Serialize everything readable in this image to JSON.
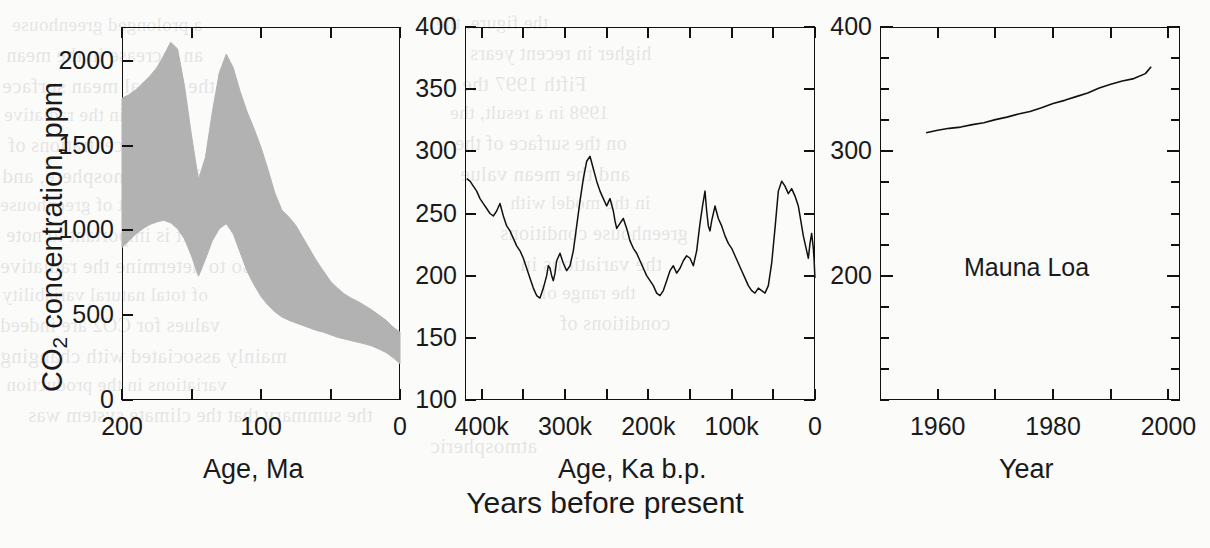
{
  "figure": {
    "caption": "Years before present",
    "background_color": "#fbfbfa",
    "ink_color": "#111111",
    "band_fill_color": "#b2b2b2"
  },
  "y_axis_title": {
    "prefix": "CO",
    "subscript": "2",
    "suffix": " concentration, ppm"
  },
  "ghost_text": [
    {
      "text": "a prolonged greenhouse",
      "x": 12,
      "y": 14
    },
    {
      "text": "an increase in the mean",
      "x": 6,
      "y": 44
    },
    {
      "text": "the annual mean surface",
      "x": 2,
      "y": 74
    },
    {
      "text": "change in the radiative",
      "x": 4,
      "y": 104
    },
    {
      "text": "the concentrations of",
      "x": 8,
      "y": 134
    },
    {
      "text": "in the atmosphere, and",
      "x": 2,
      "y": 164
    },
    {
      "text": "the amount of greenhouse",
      "x": 0,
      "y": 194
    },
    {
      "text": "It is important to note",
      "x": 6,
      "y": 224
    },
    {
      "text": "also to determine the radiative",
      "x": 0,
      "y": 254
    },
    {
      "text": "of total natural variability",
      "x": 2,
      "y": 284
    },
    {
      "text": "values for CO2 are indeed",
      "x": 0,
      "y": 314
    },
    {
      "text": "mainly associated with changing",
      "x": 0,
      "y": 344
    },
    {
      "text": "variations in the production",
      "x": 6,
      "y": 374
    },
    {
      "text": "the summary that the climate system was",
      "x": 28,
      "y": 404
    },
    {
      "text": "atmospheric",
      "x": 430,
      "y": 434
    },
    {
      "text": "the figure, the",
      "x": 436,
      "y": 12
    },
    {
      "text": "higher in recent years",
      "x": 470,
      "y": 42
    },
    {
      "text": "Fifth 1997 the",
      "x": 462,
      "y": 72
    },
    {
      "text": "1998 in a result, the",
      "x": 450,
      "y": 102
    },
    {
      "text": "on the surface of the",
      "x": 455,
      "y": 132
    },
    {
      "text": "and the mean value",
      "x": 460,
      "y": 162
    },
    {
      "text": "in the model with",
      "x": 510,
      "y": 192
    },
    {
      "text": "greenhouse conditions",
      "x": 500,
      "y": 222
    },
    {
      "text": "the variations in",
      "x": 520,
      "y": 252
    },
    {
      "text": "the range of",
      "x": 540,
      "y": 282
    },
    {
      "text": "conditions of",
      "x": 560,
      "y": 312
    }
  ],
  "chart_data": [
    {
      "type": "area",
      "panel": 1,
      "title": "",
      "xlabel": "Age, Ma",
      "ylabel": "CO2 concentration, ppm",
      "xlim": [
        200,
        0
      ],
      "ylim": [
        0,
        2200
      ],
      "x_ticks": [
        200,
        150,
        100,
        50,
        0
      ],
      "x_tick_labels": [
        "200",
        "",
        "100",
        "",
        "0"
      ],
      "y_ticks": [
        0,
        500,
        1000,
        1500,
        2000
      ],
      "y_tick_labels": [
        "0",
        "500",
        "1000",
        "1500",
        "2000"
      ],
      "grid": false,
      "series": [
        {
          "name": "GEOCARB CO2 uncertainty envelope (upper)",
          "x": [
            200,
            195,
            190,
            185,
            180,
            175,
            170,
            165,
            160,
            155,
            150,
            145,
            140,
            135,
            130,
            125,
            120,
            115,
            110,
            105,
            100,
            95,
            90,
            85,
            80,
            75,
            70,
            65,
            60,
            55,
            50,
            45,
            40,
            35,
            30,
            25,
            20,
            15,
            10,
            5,
            0
          ],
          "values": [
            1780,
            1800,
            1830,
            1870,
            1910,
            1960,
            2030,
            2110,
            2070,
            1850,
            1560,
            1300,
            1430,
            1700,
            1930,
            2040,
            1960,
            1820,
            1700,
            1600,
            1490,
            1360,
            1220,
            1120,
            1080,
            1030,
            960,
            890,
            820,
            760,
            700,
            660,
            625,
            600,
            580,
            555,
            530,
            500,
            470,
            430,
            400
          ]
        },
        {
          "name": "GEOCARB CO2 uncertainty envelope (lower)",
          "x": [
            200,
            195,
            190,
            185,
            180,
            175,
            170,
            165,
            160,
            155,
            150,
            145,
            140,
            135,
            130,
            125,
            120,
            115,
            110,
            105,
            100,
            95,
            90,
            85,
            80,
            75,
            70,
            65,
            60,
            55,
            50,
            45,
            40,
            35,
            30,
            25,
            20,
            15,
            10,
            5,
            0
          ],
          "values": [
            900,
            940,
            980,
            1010,
            1035,
            1050,
            1060,
            1045,
            1010,
            950,
            850,
            730,
            830,
            940,
            1010,
            1040,
            980,
            870,
            760,
            680,
            610,
            560,
            520,
            490,
            470,
            455,
            440,
            425,
            410,
            400,
            385,
            370,
            360,
            350,
            340,
            330,
            318,
            300,
            280,
            250,
            215
          ]
        }
      ]
    },
    {
      "type": "line",
      "panel": 2,
      "title": "",
      "xlabel": "Age, Ka b.p.",
      "ylabel": "CO2 concentration, ppm",
      "xlim": [
        420000,
        0
      ],
      "ylim": [
        100,
        400
      ],
      "x_ticks": [
        400000,
        350000,
        300000,
        250000,
        200000,
        150000,
        100000,
        50000,
        0
      ],
      "x_tick_labels": [
        "400k",
        "",
        "300k",
        "",
        "200k",
        "",
        "100k",
        "",
        "0"
      ],
      "y_ticks": [
        100,
        150,
        200,
        250,
        300,
        350,
        400
      ],
      "y_tick_labels": [
        "100",
        "150",
        "200",
        "250",
        "300",
        "350",
        "400"
      ],
      "grid": false,
      "series": [
        {
          "name": "Vostok ice core CO2",
          "x": [
            418000,
            414000,
            410000,
            406000,
            402000,
            398000,
            394000,
            390000,
            386000,
            382000,
            378000,
            374000,
            370000,
            366000,
            362000,
            358000,
            354000,
            350000,
            346000,
            342000,
            338000,
            334000,
            330000,
            326000,
            322000,
            320000,
            318000,
            316000,
            314000,
            312000,
            310000,
            306000,
            302000,
            298000,
            294000,
            290000,
            286000,
            282000,
            278000,
            274000,
            270000,
            266000,
            262000,
            258000,
            254000,
            250000,
            246000,
            242000,
            240000,
            238000,
            234000,
            230000,
            226000,
            222000,
            218000,
            214000,
            210000,
            206000,
            202000,
            198000,
            194000,
            190000,
            186000,
            182000,
            178000,
            174000,
            170000,
            166000,
            162000,
            158000,
            154000,
            150000,
            146000,
            142000,
            138000,
            135000,
            132000,
            130000,
            128000,
            126000,
            124000,
            122000,
            120000,
            116000,
            112000,
            108000,
            104000,
            100000,
            96000,
            92000,
            88000,
            84000,
            80000,
            76000,
            72000,
            68000,
            64000,
            60000,
            56000,
            52000,
            48000,
            44000,
            40000,
            36000,
            32000,
            28000,
            24000,
            20000,
            18000,
            16000,
            14000,
            12000,
            10000,
            8000,
            6000,
            4000,
            2000,
            1000,
            500,
            100
          ],
          "values": [
            278,
            276,
            272,
            268,
            262,
            258,
            254,
            250,
            248,
            252,
            258,
            248,
            240,
            236,
            230,
            224,
            220,
            214,
            206,
            198,
            190,
            184,
            182,
            190,
            200,
            208,
            206,
            200,
            196,
            202,
            212,
            218,
            210,
            204,
            208,
            220,
            240,
            260,
            278,
            292,
            296,
            286,
            276,
            268,
            262,
            256,
            262,
            252,
            244,
            238,
            242,
            246,
            238,
            228,
            222,
            218,
            212,
            206,
            200,
            196,
            192,
            186,
            184,
            188,
            196,
            204,
            208,
            202,
            206,
            212,
            216,
            214,
            208,
            220,
            242,
            256,
            268,
            252,
            240,
            236,
            244,
            250,
            256,
            246,
            240,
            232,
            226,
            222,
            216,
            210,
            204,
            198,
            192,
            188,
            186,
            190,
            188,
            186,
            192,
            210,
            238,
            268,
            276,
            272,
            266,
            270,
            264,
            256,
            248,
            240,
            232,
            226,
            220,
            214,
            226,
            234,
            222,
            212,
            204,
            198,
            190,
            186,
            182,
            188,
            196,
            204,
            212,
            198,
            192,
            186,
            190,
            198,
            206,
            196,
            188,
            182,
            180,
            184,
            196,
            220,
            248,
            262,
            268,
            252,
            248,
            252,
            268,
            284
          ]
        }
      ]
    },
    {
      "type": "line",
      "panel": 3,
      "title": "",
      "xlabel": "Year",
      "ylabel": "CO2 concentration, ppm",
      "xlim": [
        1950,
        2002
      ],
      "ylim": [
        100,
        400
      ],
      "x_ticks": [
        1960,
        1970,
        1980,
        1990,
        2000
      ],
      "x_tick_labels": [
        "1960",
        "",
        "1980",
        "",
        "2000"
      ],
      "y_ticks": [
        100,
        125,
        150,
        175,
        200,
        225,
        250,
        275,
        300,
        325,
        350,
        375,
        400
      ],
      "y_tick_labels": [
        "",
        "",
        "",
        "",
        "200",
        "",
        "",
        "",
        "300",
        "",
        "",
        "",
        "400"
      ],
      "grid": false,
      "annotation": "Mauna Loa",
      "series": [
        {
          "name": "Mauna Loa CO2",
          "x": [
            1958,
            1960,
            1962,
            1964,
            1966,
            1968,
            1970,
            1972,
            1974,
            1976,
            1978,
            1980,
            1982,
            1984,
            1986,
            1988,
            1990,
            1992,
            1994,
            1996,
            1997
          ],
          "values": [
            315,
            317,
            318.5,
            319.5,
            321.5,
            323,
            325.5,
            327.5,
            330,
            332,
            335,
            338.5,
            341,
            344,
            347,
            351,
            354,
            356.5,
            358.5,
            362.5,
            368
          ]
        }
      ]
    }
  ]
}
